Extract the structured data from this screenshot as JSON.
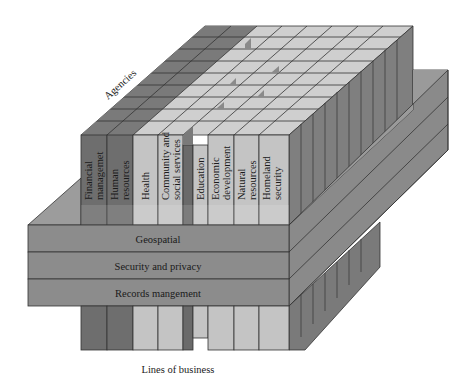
{
  "diagram": {
    "axis_labels": {
      "agencies": "Agencies",
      "lines_of_business": "Lines of business"
    },
    "lines_of_business": [
      {
        "label_line1": "Financial",
        "label_line2": "managemet",
        "shade": "dark"
      },
      {
        "label_line1": "Human",
        "label_line2": "resources",
        "shade": "dark"
      },
      {
        "label_line1": "Health",
        "label_line2": "",
        "shade": "light"
      },
      {
        "label_line1": "Community and",
        "label_line2": "social services",
        "shade": "light"
      },
      {
        "label_line1": "",
        "label_line2": "",
        "shade": "dark"
      },
      {
        "label_line1": "Education",
        "label_line2": "",
        "shade": "light"
      },
      {
        "label_line1": "Economic",
        "label_line2": "development",
        "shade": "light"
      },
      {
        "label_line1": "Natural",
        "label_line2": "resources",
        "shade": "light"
      },
      {
        "label_line1": "Homeland",
        "label_line2": "security",
        "shade": "light"
      }
    ],
    "cross_cutting_layers": [
      {
        "label": "Geospatial"
      },
      {
        "label": "Security and privacy"
      },
      {
        "label": "Records mangement"
      }
    ],
    "colors": {
      "dark_column": "#6e6e6e",
      "light_column": "#c4c4c4",
      "dark_top": "#7a7a7a",
      "light_top": "#cfcfcf",
      "side_face": "#7f7f7f",
      "slab_front": "#8c8c8c",
      "slab_side": "#8a8a8a",
      "slab_top": "#9c9c9c",
      "edge": "#333333",
      "background": "#ffffff"
    }
  }
}
